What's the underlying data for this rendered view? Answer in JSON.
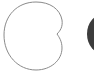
{
  "canvas": {
    "width": 94,
    "height": 80,
    "background": "#ffffff"
  },
  "shapes": {
    "cardioid": {
      "stroke": "#8a8a8a",
      "fill": "#ffffff",
      "stroke_width": 1
    },
    "dark_ellipse": {
      "fill": "#3c3c3c",
      "cx": 104,
      "cy": 34,
      "rx": 17,
      "ry": 20
    }
  }
}
